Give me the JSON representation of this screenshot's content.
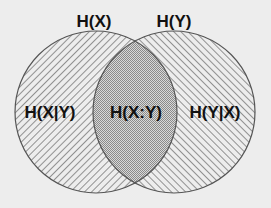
{
  "diagram": {
    "type": "venn",
    "sets": [
      {
        "id": "X",
        "label": "H(X)",
        "only_label": "H(X|Y)",
        "hatch": "backslash"
      },
      {
        "id": "Y",
        "label": "H(Y)",
        "only_label": "H(Y|X)",
        "hatch": "slash"
      }
    ],
    "intersection_label": "H(X:Y)",
    "colors": {
      "background": "#ededed",
      "outline": "#555555",
      "hatch": "#6a6a6a",
      "dots": "#8a8a8a",
      "text": "#111111"
    }
  }
}
